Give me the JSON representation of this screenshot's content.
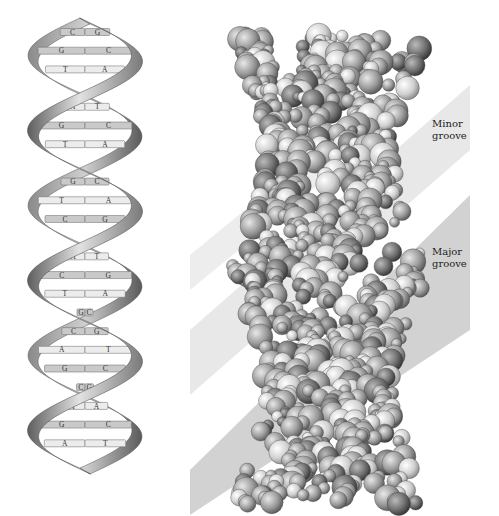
{
  "figure": {
    "type": "DNA double helix illustration",
    "left_panel": {
      "name": "ribbon-model",
      "base_pairs": [
        {
          "left": "C",
          "right": "G"
        },
        {
          "left": "G",
          "right": "C"
        },
        {
          "left": "T",
          "right": "A"
        },
        {
          "left": "C",
          "right": "G"
        },
        {
          "left": "A",
          "right": "T"
        },
        {
          "left": "G",
          "right": "C"
        },
        {
          "left": "T",
          "right": "A"
        },
        {
          "left": "C",
          "right": "G"
        },
        {
          "left": "G",
          "right": "C"
        },
        {
          "left": "T",
          "right": "A"
        },
        {
          "left": "C",
          "right": "G"
        },
        {
          "left": "G",
          "right": "C"
        },
        {
          "left": "A",
          "right": "T"
        },
        {
          "left": "C",
          "right": "G"
        },
        {
          "left": "T",
          "right": "A"
        },
        {
          "left": "G",
          "right": "C"
        },
        {
          "left": "C",
          "right": "G"
        },
        {
          "left": "A",
          "right": "T"
        },
        {
          "left": "G",
          "right": "C"
        },
        {
          "left": "C",
          "right": "G"
        },
        {
          "left": "T",
          "right": "A"
        },
        {
          "left": "G",
          "right": "C"
        },
        {
          "left": "A",
          "right": "T"
        }
      ]
    },
    "right_panel": {
      "name": "space-filling-model",
      "labels": {
        "minor_groove_line1": "Minor",
        "minor_groove_line2": "groove",
        "major_groove_line1": "Major",
        "major_groove_line2": "groove"
      }
    },
    "colors": {
      "background": "#ffffff",
      "ribbon_light": "#d8d8d8",
      "ribbon_dark": "#6a6a6a",
      "base_fill": "#c9c9c9",
      "base_fill_light": "#ececec",
      "minor_band": "#e6e6e6",
      "major_band": "#cfcfcf",
      "atom_mid": "#9a9a9a"
    }
  }
}
